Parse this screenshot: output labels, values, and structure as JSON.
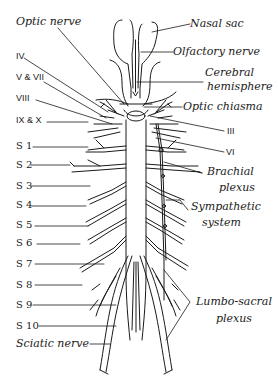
{
  "figure": {
    "left_labels": {
      "optic_nerve": "Optic nerve",
      "iv": "IV",
      "v_vii": "V & VII",
      "viii": "VIII",
      "ix_x": "IX & X",
      "spinal": [
        "S 1",
        "S 2",
        "S 3",
        "S 4",
        "S 5",
        "S 6",
        "S 7",
        "S 8",
        "S 9",
        "S 10"
      ],
      "sciatic_nerve": "Sciatic nerve"
    },
    "right_labels": {
      "nasal_sac": "Nasal sac",
      "olfactory_nerve": "Olfactory nerve",
      "cerebral_1": "Cerebral",
      "cerebral_2": "hemisphere",
      "optic_chiasma": "Optic chiasma",
      "iii": "III",
      "vi": "VI",
      "brachial_1": "Brachial",
      "brachial_2": "plexus",
      "sympathetic_1": "Sympathetic",
      "sympathetic_2": "system",
      "lumbo_1": "Lumbo-sacral",
      "lumbo_2": "plexus"
    },
    "colors": {
      "ink": "#1a1a1a",
      "background": "#ffffff"
    }
  }
}
